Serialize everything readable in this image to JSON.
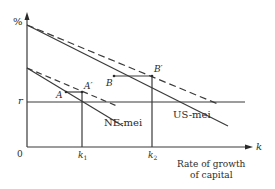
{
  "diagram": {
    "y_axis_label": "%",
    "x_axis_label": "k",
    "origin_label": "0",
    "r_label": "r",
    "x_axis_title_line1": "Rate of growth",
    "x_axis_title_line2": "of capital",
    "k1_label": "k",
    "k1_sub": "1",
    "k2_label": "k",
    "k2_sub": "2",
    "point_A": "A",
    "point_A_prime": "A′",
    "point_B": "B",
    "point_B_prime": "B′",
    "us_curve_label": "US-mei",
    "ne_curve_label": "NE-mei",
    "line_color": "#3a3a3a"
  }
}
